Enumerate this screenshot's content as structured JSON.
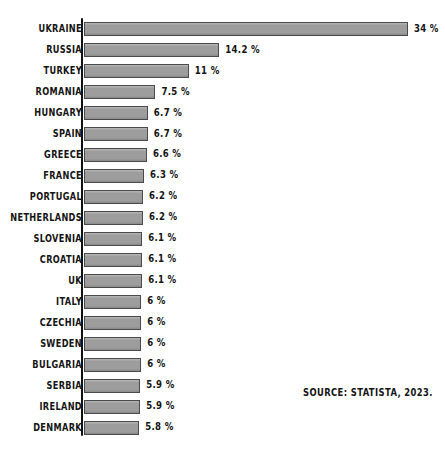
{
  "chart_data": {
    "type": "bar",
    "orientation": "horizontal",
    "title": "",
    "subtitle": "",
    "xlabel": "",
    "ylabel": "",
    "grid": false,
    "legend": null,
    "legend_position": "none",
    "xlim": [
      0,
      34
    ],
    "value_suffix": "%",
    "categories": [
      "UKRAINE",
      "RUSSIA",
      "TURKEY",
      "ROMANIA",
      "HUNGARY",
      "SPAIN",
      "GREECE",
      "FRANCE",
      "PORTUGAL",
      "NETHERLANDS",
      "SLOVENIA",
      "CROATIA",
      "UK",
      "ITALY",
      "CZECHIA",
      "SWEDEN",
      "BULGARIA",
      "SERBIA",
      "IRELAND",
      "DENMARK"
    ],
    "values": [
      34,
      14.2,
      11,
      7.5,
      6.7,
      6.7,
      6.6,
      6.3,
      6.2,
      6.2,
      6.1,
      6.1,
      6.1,
      6,
      6,
      6,
      6,
      5.9,
      5.9,
      5.8
    ],
    "value_labels": [
      "34 %",
      "14.2 %",
      "11 %",
      "7.5 %",
      "6.7 %",
      "6.7 %",
      "6.6 %",
      "6.3 %",
      "6.2 %",
      "6.2 %",
      "6.1 %",
      "6.1 %",
      "6.1 %",
      "6 %",
      "6 %",
      "6 %",
      "6 %",
      "5.9 %",
      "5.9 %",
      "5.8 %"
    ],
    "annotations": [
      "SOURCE: STATISTA, 2023."
    ],
    "colors": {
      "bar_fill": "#9d9d9d",
      "bar_stroke": "#4a4a4a",
      "axis": "#111111",
      "text": "#141414",
      "background": "#ffffff"
    }
  },
  "source": {
    "text": "SOURCE: STATISTA, 2023."
  }
}
